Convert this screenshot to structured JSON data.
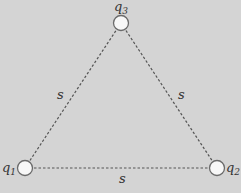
{
  "diagram": {
    "background": "#d4d4d4",
    "line_color": "#555555",
    "charge_fill": "#f7f7f7",
    "charge_stroke": "#6a6a6a",
    "charges": [
      {
        "id": "q1",
        "symbol": "q",
        "subscript": "1",
        "x": 25,
        "y": 168
      },
      {
        "id": "q2",
        "symbol": "q",
        "subscript": "2",
        "x": 217,
        "y": 168
      },
      {
        "id": "q3",
        "symbol": "q",
        "subscript": "3",
        "x": 121,
        "y": 23
      }
    ],
    "sides": [
      {
        "from": "q1",
        "to": "q3",
        "label": "s"
      },
      {
        "from": "q3",
        "to": "q2",
        "label": "s"
      },
      {
        "from": "q1",
        "to": "q2",
        "label": "s"
      }
    ]
  }
}
